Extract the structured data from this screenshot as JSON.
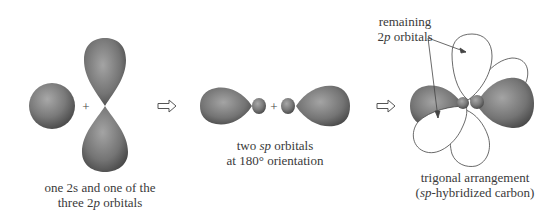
{
  "figure": {
    "stage1": {
      "caption_line1": "one 2s and one of the",
      "caption_line2_pre": "three  2",
      "caption_line2_italic": "p",
      "caption_line2_post": " orbitals",
      "operator": "+"
    },
    "stage2": {
      "caption_line1_pre": "two ",
      "caption_line1_italic": "sp",
      "caption_line1_post": " orbitals",
      "caption_line2": "at 180° orientation",
      "operator": "+"
    },
    "stage3": {
      "annotation_line1": "remaining",
      "annotation_line2_pre": "2",
      "annotation_line2_italic": "p",
      "annotation_line2_post": " orbitals",
      "caption_line1": "trigonal arrangement",
      "caption_line2_pre": "(",
      "caption_line2_italic": "sp",
      "caption_line2_post": "-hybridized carbon)"
    },
    "arrows": [
      "open-right-arrow",
      "open-right-arrow"
    ],
    "colors": {
      "orbital_fill_dark": "#5a5a5a",
      "orbital_fill_light": "#9a9a9a",
      "outline": "#444444",
      "text": "#3a3a3a"
    }
  }
}
